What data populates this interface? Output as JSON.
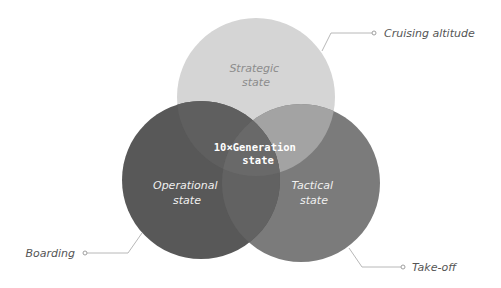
{
  "diagram": {
    "type": "venn",
    "circles": [
      {
        "id": "strategic",
        "label_line1": "Strategic",
        "label_line2": "state",
        "cx": 256,
        "cy": 97,
        "r": 79,
        "fill": "#d5d5d5",
        "text_color": "#8c8c8c"
      },
      {
        "id": "operational",
        "label_line1": "Operational",
        "label_line2": "state",
        "cx": 201,
        "cy": 180,
        "r": 79,
        "fill": "#585858",
        "text_color": "#f0f0f0"
      },
      {
        "id": "tactical",
        "label_line1": "Tactical",
        "label_line2": "state",
        "cx": 301,
        "cy": 183,
        "r": 79,
        "fill": "#7b7b7b",
        "text_color": "#f0f0f0"
      }
    ],
    "center": {
      "label_line1": "10×Generation",
      "label_line2": "state",
      "text_color": "#ffffff"
    },
    "callouts": [
      {
        "id": "cruising-altitude",
        "text": "Cruising altitude",
        "connects_to": "strategic"
      },
      {
        "id": "boarding",
        "text": "Boarding",
        "connects_to": "operational"
      },
      {
        "id": "take-off",
        "text": "Take-off",
        "connects_to": "tactical"
      }
    ],
    "colors": {
      "connector": "#b8b8b8",
      "callout_text": "#555555"
    }
  }
}
